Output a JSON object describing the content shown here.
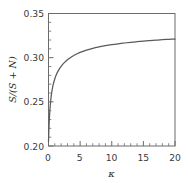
{
  "chart_data": {
    "type": "line",
    "title": "",
    "xlabel": "κ",
    "ylabel": "S/(S + N)",
    "xlim": [
      0,
      20
    ],
    "ylim": [
      0.2,
      0.35
    ],
    "grid": false,
    "legend": null,
    "x_ticks": [
      0,
      5,
      10,
      15,
      20
    ],
    "x_tick_labels": [
      "0",
      "5",
      "10",
      "15",
      "20"
    ],
    "x_minor_step": 1,
    "y_ticks": [
      0.2,
      0.25,
      0.3,
      0.35
    ],
    "y_tick_labels": [
      "0.20",
      "0.25",
      "0.30",
      "0.35"
    ],
    "y_minor_step": 0.01,
    "series": [
      {
        "name": "S/(S + N)",
        "color": "#5a5a5a",
        "x": [
          0,
          0.1,
          0.2,
          0.3,
          0.4,
          0.5,
          0.7,
          1,
          1.3,
          1.6,
          2,
          2.5,
          3,
          3.5,
          4,
          4.5,
          5,
          6,
          7,
          8,
          9,
          10,
          11,
          12,
          13,
          14,
          15,
          16,
          17,
          18,
          19,
          20
        ],
        "y": [
          0.205,
          0.2255,
          0.2385,
          0.2477,
          0.2546,
          0.2601,
          0.2683,
          0.2762,
          0.2817,
          0.2859,
          0.2902,
          0.2944,
          0.2977,
          0.3003,
          0.3025,
          0.3043,
          0.3059,
          0.3085,
          0.3105,
          0.3121,
          0.3135,
          0.3147,
          0.3157,
          0.3166,
          0.3174,
          0.3181,
          0.3187,
          0.3193,
          0.3198,
          0.3203,
          0.3207,
          0.3211
        ]
      }
    ],
    "annotations": []
  },
  "figure": {
    "axis_color": "#6b6b6b",
    "curve_color": "#5a5a5a",
    "background": "#ffffff"
  }
}
